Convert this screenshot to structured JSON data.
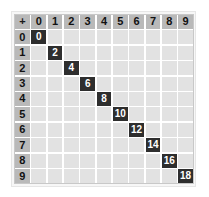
{
  "table": {
    "operator": "+",
    "column_headers": [
      "0",
      "1",
      "2",
      "3",
      "4",
      "5",
      "6",
      "7",
      "8",
      "9"
    ],
    "row_headers": [
      "0",
      "1",
      "2",
      "3",
      "4",
      "5",
      "6",
      "7",
      "8",
      "9"
    ],
    "filled_cells": [
      {
        "row": 0,
        "col": 0,
        "value": "0"
      },
      {
        "row": 1,
        "col": 1,
        "value": "2"
      },
      {
        "row": 2,
        "col": 2,
        "value": "4"
      },
      {
        "row": 3,
        "col": 3,
        "value": "6"
      },
      {
        "row": 4,
        "col": 4,
        "value": "8"
      },
      {
        "row": 5,
        "col": 5,
        "value": "10"
      },
      {
        "row": 6,
        "col": 6,
        "value": "12"
      },
      {
        "row": 7,
        "col": 7,
        "value": "14"
      },
      {
        "row": 8,
        "col": 8,
        "value": "16"
      },
      {
        "row": 9,
        "col": 9,
        "value": "18"
      }
    ]
  },
  "colors": {
    "header_bg": "#b9b9b9",
    "cell_bg": "#e2e2e2",
    "highlight_bg": "#2e2e2e",
    "highlight_text": "#ffffff"
  }
}
